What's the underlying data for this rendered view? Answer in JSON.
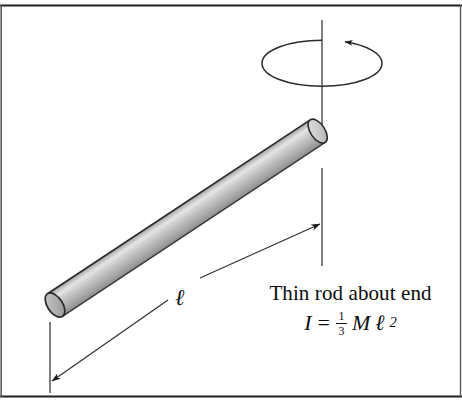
{
  "figure": {
    "background_color": "#ffffff",
    "border_color": "#1a1a1a",
    "caption": {
      "line1": "Thin rod about end",
      "formula": {
        "symbol_I": "I",
        "equals": "=",
        "fraction_numerator": "1",
        "fraction_denominator": "3",
        "mass_symbol": "M",
        "length_symbol": "ℓ",
        "exponent": "2",
        "plain_text": "I = 1/3 M ℓ2"
      }
    },
    "labels": {
      "length_label": "ℓ"
    },
    "elements": {
      "rotation_axis": "vertical-dashed-axis",
      "rotation_arrow": "ellipse-with-arrowhead",
      "rod": "shaded-cylinder",
      "dimension_line": "double-headed-length-arrow",
      "extension_line_left": "left-vertical-extension",
      "extension_line_right": "right-vertical-extension"
    },
    "colors": {
      "rod_light": "#d8d8d8",
      "rod_mid": "#b4b4b4",
      "rod_dark": "#8a8a8a",
      "rod_outline": "#262626",
      "line": "#3a3a3a",
      "text": "#0d0d0d"
    },
    "geometry": {
      "rod_start_x": 55,
      "rod_start_y": 305,
      "rod_end_x": 318,
      "rod_end_y": 131,
      "rod_angle_deg": -33.5,
      "rod_thickness": 27,
      "axis_x": 322,
      "axis_top_y": 20,
      "axis_bottom_y": 140,
      "ellipse_cx": 322,
      "ellipse_cy": 63,
      "ellipse_rx": 60,
      "ellipse_ry": 23
    }
  }
}
